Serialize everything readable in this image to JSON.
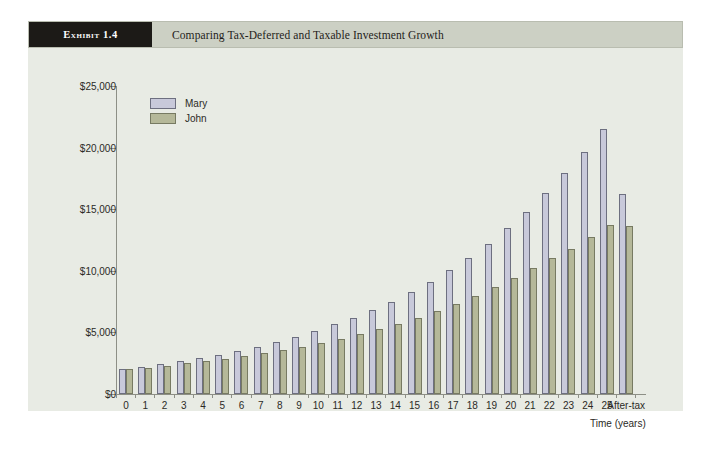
{
  "exhibit": {
    "tag": "Exhibit 1.4",
    "title": "Comparing Tax-Deferred and Taxable Investment Growth"
  },
  "legend": {
    "items": [
      {
        "label": "Mary",
        "color": "#c8c9da"
      },
      {
        "label": "John",
        "color": "#b5b899"
      }
    ]
  },
  "colors": {
    "panel_background": "#e8ebe4",
    "header_background": "#ccd0c4",
    "tag_background": "#1c1a17",
    "mary_fill": "#c8c9da",
    "john_fill": "#b5b899",
    "axis": "#8d8f86"
  },
  "chart_data": {
    "type": "bar",
    "title": "Comparing Tax-Deferred and Taxable Investment Growth",
    "xlabel": "Time (years)",
    "ylabel": "",
    "ylim": [
      0,
      25000
    ],
    "ytick_labels": [
      "$0",
      "$5,000",
      "$10,000",
      "$15,000",
      "$20,000",
      "$25,000"
    ],
    "ytick_values": [
      0,
      5000,
      10000,
      15000,
      20000,
      25000
    ],
    "grid": false,
    "legend_position": "upper-left",
    "categories": [
      "0",
      "1",
      "2",
      "3",
      "4",
      "5",
      "6",
      "7",
      "8",
      "9",
      "10",
      "11",
      "12",
      "13",
      "14",
      "15",
      "16",
      "17",
      "18",
      "19",
      "20",
      "21",
      "22",
      "23",
      "24",
      "25",
      "After-tax"
    ],
    "series": [
      {
        "name": "Mary",
        "values": [
          2000,
          2200,
          2400,
          2650,
          2900,
          3200,
          3500,
          3850,
          4250,
          4650,
          5100,
          5650,
          6200,
          6800,
          7500,
          8250,
          9100,
          10050,
          11050,
          12200,
          13450,
          14800,
          16300,
          17900,
          19650,
          21550,
          16200
        ]
      },
      {
        "name": "John",
        "values": [
          2000,
          2150,
          2300,
          2480,
          2650,
          2850,
          3050,
          3300,
          3550,
          3850,
          4150,
          4500,
          4850,
          5250,
          5700,
          6200,
          6750,
          7300,
          7950,
          8650,
          9400,
          10200,
          11000,
          11750,
          12750,
          13700,
          13600
        ]
      }
    ]
  }
}
